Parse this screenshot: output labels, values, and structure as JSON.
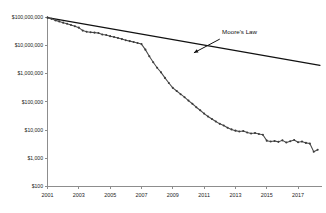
{
  "chart_data": {
    "type": "line",
    "title": "",
    "xlabel": "",
    "ylabel": "",
    "yscale": "log",
    "ylim": [
      100,
      100000000
    ],
    "xlim": [
      2001,
      2018.4
    ],
    "grid": false,
    "legend": "none",
    "y_ticks": [
      {
        "value": 100000000,
        "label": "$100,000,000"
      },
      {
        "value": 10000000,
        "label": "$10,000,000"
      },
      {
        "value": 1000000,
        "label": "$1,000,000"
      },
      {
        "value": 100000,
        "label": "$100,000"
      },
      {
        "value": 10000,
        "label": "$10,000"
      },
      {
        "value": 1000,
        "label": "$1,000"
      },
      {
        "value": 100,
        "label": "$100"
      }
    ],
    "x_ticks": [
      {
        "value": 2001,
        "label": "2001"
      },
      {
        "value": 2003,
        "label": "2003"
      },
      {
        "value": 2005,
        "label": "2005"
      },
      {
        "value": 2007,
        "label": "2007"
      },
      {
        "value": 2009,
        "label": "2009"
      },
      {
        "value": 2011,
        "label": "2011"
      },
      {
        "value": 2013,
        "label": "2013"
      },
      {
        "value": 2015,
        "label": "2015"
      },
      {
        "value": 2017,
        "label": "2017"
      }
    ],
    "annotations": [
      {
        "name": "moores-law",
        "text": "Moore's Law",
        "text_x": 2012.15,
        "text_y": 26000000,
        "arrow_from_x": 2012.0,
        "arrow_from_y": 16500000,
        "arrow_to_x": 2010.35,
        "arrow_to_y": 5400000
      }
    ],
    "series": [
      {
        "name": "Moore's Law",
        "style": "reference",
        "markers": false,
        "color": "#111111",
        "x": [
          2001.0,
          2018.4
        ],
        "y": [
          95000000,
          1950000
        ]
      },
      {
        "name": "Cost per Genome",
        "style": "data",
        "markers": true,
        "color": "#3c3c3c",
        "x": [
          2001.0,
          2001.25,
          2001.5,
          2001.75,
          2002.0,
          2002.25,
          2002.5,
          2002.75,
          2003.0,
          2003.25,
          2003.5,
          2003.75,
          2004.0,
          2004.25,
          2004.5,
          2004.75,
          2005.0,
          2005.25,
          2005.5,
          2005.75,
          2006.0,
          2006.25,
          2006.5,
          2006.75,
          2007.0,
          2007.25,
          2007.5,
          2007.75,
          2008.0,
          2008.25,
          2008.5,
          2008.75,
          2009.0,
          2009.25,
          2009.5,
          2009.75,
          2010.0,
          2010.25,
          2010.5,
          2010.75,
          2011.0,
          2011.25,
          2011.5,
          2011.75,
          2012.0,
          2012.25,
          2012.5,
          2012.75,
          2013.0,
          2013.25,
          2013.5,
          2013.75,
          2014.0,
          2014.25,
          2014.5,
          2014.75,
          2015.0,
          2015.25,
          2015.5,
          2015.75,
          2016.0,
          2016.25,
          2016.5,
          2016.75,
          2017.0,
          2017.25,
          2017.5,
          2017.75,
          2018.0,
          2018.25
        ],
        "y": [
          95000000,
          86000000,
          76000000,
          70000000,
          63000000,
          58000000,
          52000000,
          47000000,
          42000000,
          33000000,
          30000000,
          29000000,
          28000000,
          27000000,
          24000000,
          23000000,
          21000000,
          19500000,
          18000000,
          16500000,
          15000000,
          14000000,
          13000000,
          12000000,
          11000000,
          7000000,
          4100000,
          2500000,
          1600000,
          1100000,
          700000,
          460000,
          310000,
          240000,
          185000,
          145000,
          110000,
          85000,
          64000,
          50000,
          38000,
          30000,
          24500,
          20000,
          16500,
          14500,
          12000,
          10500,
          9500,
          8800,
          9200,
          8200,
          7500,
          7800,
          7200,
          6800,
          4200,
          3900,
          4100,
          3800,
          4300,
          3600,
          4000,
          4400,
          3700,
          3900,
          3500,
          3300,
          1700,
          2000
        ]
      }
    ]
  }
}
